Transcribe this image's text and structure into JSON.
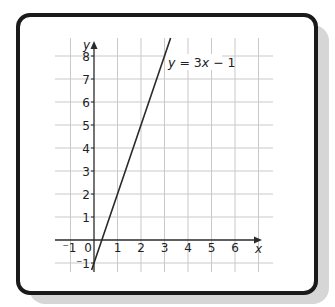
{
  "chart_data": {
    "type": "line",
    "title": "",
    "xlabel": "x",
    "ylabel": "y",
    "xlim": [
      -1.6,
      7.6
    ],
    "ylim": [
      -1.4,
      8.7
    ],
    "grid": true,
    "x_ticks": [
      -1,
      0,
      1,
      2,
      3,
      4,
      5,
      6
    ],
    "y_ticks": [
      -1,
      1,
      2,
      3,
      4,
      5,
      6,
      7,
      8
    ],
    "x_tick_labels": [
      "⁻1",
      "0",
      "1",
      "2",
      "3",
      "4",
      "5",
      "6"
    ],
    "y_tick_labels": [
      "⁻1",
      "1",
      "2",
      "3",
      "4",
      "5",
      "6",
      "7",
      "8"
    ],
    "series": [
      {
        "name": "y = 3x − 1",
        "equation": "y = 3x - 1",
        "slope": 3,
        "intercept": -1,
        "x": [
          -0.1,
          0,
          1,
          2,
          3,
          3.26
        ],
        "y": [
          -1.3,
          -1,
          2,
          5,
          8,
          8.78
        ],
        "color": "#2a2a2a"
      }
    ],
    "annotations": [
      {
        "text": "y = 3x − 1",
        "x": 3.2,
        "y": 7.7
      }
    ]
  },
  "labels": {
    "x_axis": "x",
    "y_axis": "y",
    "equation_y": "y",
    "equation_mid": " = 3",
    "equation_x": "x",
    "equation_end": " − 1",
    "x_ticks": [
      "⁻1",
      "0",
      "1",
      "2",
      "3",
      "4",
      "5",
      "6"
    ],
    "y_ticks": [
      "⁻1",
      "1",
      "2",
      "3",
      "4",
      "5",
      "6",
      "7",
      "8"
    ]
  },
  "colors": {
    "grid": "#c9c9c9",
    "axis": "#2a2a2a",
    "line": "#2a2a2a",
    "frame": "#1a1a1a",
    "shadow": "#d6d6d6"
  }
}
